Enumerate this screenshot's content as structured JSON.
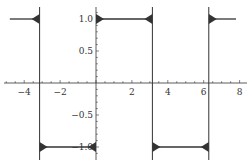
{
  "chart_data": {
    "type": "line",
    "title": "",
    "xlabel": "",
    "ylabel": "",
    "xlim": [
      -5,
      8.5
    ],
    "ylim": [
      -1.2,
      1.2
    ],
    "grid": false,
    "legend": null,
    "x_ticks": [
      -4,
      -2,
      2,
      4,
      6,
      8
    ],
    "x_tick_labels": [
      "−4",
      "−2",
      "2",
      "4",
      "6",
      "8"
    ],
    "y_ticks": [
      1.0,
      0.5,
      -0.5,
      -1.0
    ],
    "y_tick_labels": [
      "1.0",
      "0.5",
      "−0.5",
      "−1.0"
    ],
    "series": [
      {
        "name": "square wave approximation",
        "color": "#333333",
        "x": [
          -4.8,
          -3.1416,
          -3.1416,
          0,
          0,
          3.1416,
          3.1416,
          6.2832,
          6.2832,
          7.8
        ],
        "y": [
          1,
          1,
          -1,
          -1,
          1,
          1,
          -1,
          -1,
          1,
          1
        ]
      }
    ],
    "discontinuities": [
      -3.1416,
      0,
      3.1416,
      6.2832
    ],
    "axes_color": "#333333"
  }
}
